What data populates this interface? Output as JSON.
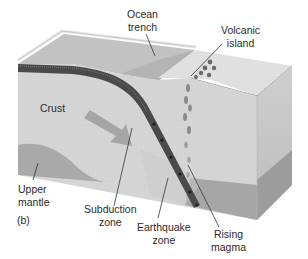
{
  "figure": {
    "panel_label": "(b)"
  },
  "labels": {
    "ocean_trench": [
      "Ocean",
      "trench"
    ],
    "volcanic_island": [
      "Volcanic",
      "island"
    ],
    "crust": [
      "Crust"
    ],
    "upper_mantle": [
      "Upper",
      "mantle"
    ],
    "subduction_zone": [
      "Subduction",
      "zone"
    ],
    "earthquake_zone": [
      "Earthquake",
      "zone"
    ],
    "rising_magma": [
      "Rising",
      "magma"
    ]
  },
  "colors": {
    "top_surface": "#c8c8c8",
    "top_light": "#e2e2e2",
    "front_face": "#d6d6d6",
    "side_face": "#bdbdbd",
    "mantle": "#a8a8a8",
    "mantle_side": "#9a9a9a",
    "slab": "#4a4a4a",
    "magma": "#8a8a8a",
    "arrow": "#9c9c9c",
    "text": "#2a2a2a",
    "leader": "#333333"
  }
}
